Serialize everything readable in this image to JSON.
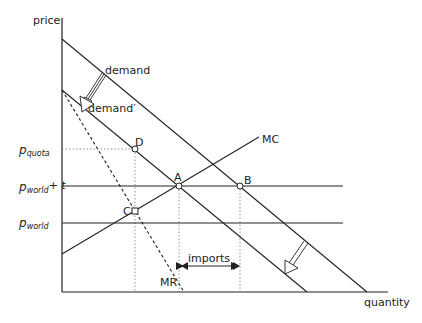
{
  "axes": {
    "y_label": "price",
    "x_label": "quantity"
  },
  "curves": {
    "demand": "demand",
    "demand_prime": "demand′",
    "mc": "MC",
    "mr": "MR"
  },
  "price_levels": {
    "p_quota": {
      "base": "p",
      "sub": "quota"
    },
    "p_world_t": {
      "base": "p",
      "sub": "world",
      "suffix": "+ t"
    },
    "p_world": {
      "base": "p",
      "sub": "world"
    }
  },
  "points": {
    "A": "A",
    "B": "B",
    "C": "C",
    "D": "D"
  },
  "annotations": {
    "imports": "imports"
  },
  "colors": {
    "line": "#222222",
    "guide": "#777777",
    "background": "#ffffff"
  }
}
